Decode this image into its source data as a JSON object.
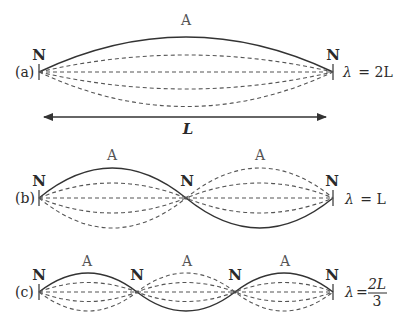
{
  "diagram": {
    "type": "standing-waves-fixed-ends",
    "panels": [
      {
        "id": "a",
        "case_label": "(a)",
        "node_label": "N",
        "antinode_label": "A",
        "nodes": 2,
        "antinodes": 1,
        "wavelength_equation": "λ = 2L",
        "eq_lambda": "λ",
        "eq_rhs": "= 2L"
      },
      {
        "id": "b",
        "case_label": "(b)",
        "node_label": "N",
        "antinode_label": "A",
        "nodes": 3,
        "antinodes": 2,
        "wavelength_equation": "λ = L",
        "eq_lambda": "λ",
        "eq_rhs": "= L"
      },
      {
        "id": "c",
        "case_label": "(c)",
        "node_label": "N",
        "antinode_label": "A",
        "nodes": 4,
        "antinodes": 3,
        "wavelength_equation": "λ = 2L/3",
        "eq_lambda": "λ",
        "eq_eq": "=",
        "eq_num": "2L",
        "eq_den": "3"
      }
    ],
    "length_arrow": {
      "label": "L"
    }
  }
}
